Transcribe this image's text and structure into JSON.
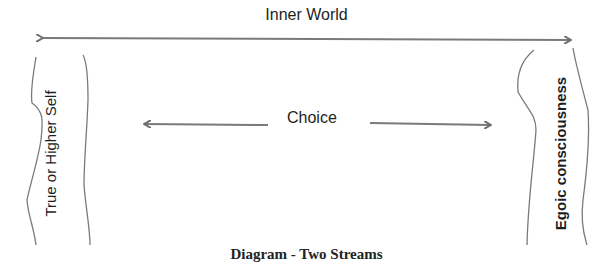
{
  "diagram": {
    "title_top": "Inner World",
    "center_label": "Choice",
    "left_stream_label": "True or Higher Self",
    "right_stream_label": "Egoic consciousness",
    "caption": "Diagram - Two Streams",
    "colors": {
      "line": "#7a7a7a",
      "text": "#1e1e1e",
      "background": "#ffffff"
    }
  }
}
